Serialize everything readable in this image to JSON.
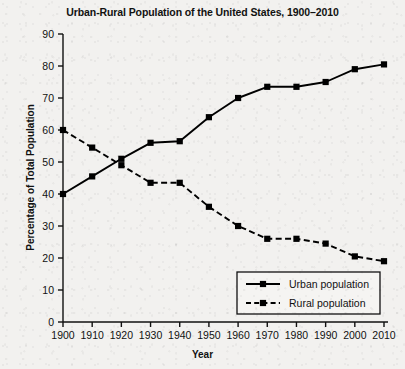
{
  "chart_data": {
    "type": "line",
    "title": "Urban-Rural Population of the United States, 1900–2010",
    "xlabel": "Year",
    "ylabel": "Percentage of Total Population",
    "x": [
      1900,
      1910,
      1920,
      1930,
      1940,
      1950,
      1960,
      1970,
      1980,
      1990,
      2000,
      2010
    ],
    "xtick_labels": [
      "1900",
      "1910",
      "1920",
      "1930",
      "1940",
      "1950",
      "1960",
      "1970",
      "1980",
      "1990",
      "2000",
      "2010"
    ],
    "ytick_labels": [
      "0",
      "10",
      "20",
      "30",
      "40",
      "50",
      "60",
      "70",
      "80",
      "90"
    ],
    "ytick_values": [
      0,
      10,
      20,
      30,
      40,
      50,
      60,
      70,
      80,
      90
    ],
    "ylim": [
      0,
      90
    ],
    "xlim": [
      1900,
      2010
    ],
    "grid": false,
    "legend_position": "lower-right",
    "series": [
      {
        "name": "Urban population",
        "style": "solid",
        "marker": "square",
        "color": "#000000",
        "values": [
          40,
          45.5,
          51,
          56,
          56.5,
          64,
          70,
          73.5,
          73.5,
          75,
          79,
          80.5
        ]
      },
      {
        "name": "Rural population",
        "style": "dashed",
        "marker": "square",
        "color": "#000000",
        "values": [
          60,
          54.5,
          49,
          43.5,
          43.5,
          36,
          30,
          26,
          26,
          24.5,
          20.5,
          19
        ]
      }
    ]
  },
  "legend": {
    "items": [
      {
        "label": "Urban population"
      },
      {
        "label": "Rural population"
      }
    ]
  }
}
